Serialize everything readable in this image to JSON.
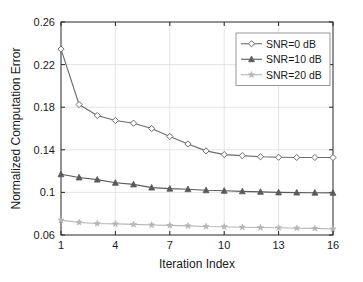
{
  "chart_data": {
    "type": "line",
    "title": "",
    "xlabel": "Iteration Index",
    "ylabel": "Normalized Computation Error",
    "x": [
      1,
      2,
      3,
      4,
      5,
      6,
      7,
      8,
      9,
      10,
      11,
      12,
      13,
      14,
      15,
      16
    ],
    "xlim": [
      1,
      16
    ],
    "ylim": [
      0.06,
      0.26
    ],
    "xticks": [
      1,
      4,
      7,
      10,
      13,
      16
    ],
    "xtick_labels": [
      "1",
      "4",
      "7",
      "10",
      "13",
      "16"
    ],
    "yticks": [
      0.06,
      0.1,
      0.14,
      0.18,
      0.22,
      0.26
    ],
    "ytick_labels": [
      "0.06",
      "0.1",
      "0.14",
      "0.18",
      "0.22",
      "0.26"
    ],
    "grid": true,
    "legend_position": "upper right",
    "series": [
      {
        "name": "SNR=0 dB",
        "marker": "diamond",
        "color": "#6b6b6b",
        "values": [
          0.2345,
          0.1825,
          0.1722,
          0.1675,
          0.165,
          0.16,
          0.1525,
          0.1455,
          0.139,
          0.1355,
          0.1345,
          0.1335,
          0.133,
          0.1328,
          0.1328,
          0.1327
        ]
      },
      {
        "name": "SNR=10 dB",
        "marker": "triangle",
        "color": "#5a5a5a",
        "values": [
          0.117,
          0.114,
          0.112,
          0.109,
          0.1075,
          0.1045,
          0.1035,
          0.103,
          0.102,
          0.1015,
          0.101,
          0.1005,
          0.1,
          0.0998,
          0.0997,
          0.0996
        ]
      },
      {
        "name": "SNR=20 dB",
        "marker": "star",
        "color": "#b5b5b5",
        "values": [
          0.074,
          0.0718,
          0.0708,
          0.0704,
          0.07,
          0.0694,
          0.069,
          0.0686,
          0.068,
          0.0678,
          0.0673,
          0.067,
          0.0668,
          0.0664,
          0.0662,
          0.0657
        ]
      }
    ]
  },
  "colors": {
    "axis": "#262626",
    "grid": "#d9d9d9",
    "background": "#ffffff",
    "legend_border": "#8c8c8c"
  }
}
